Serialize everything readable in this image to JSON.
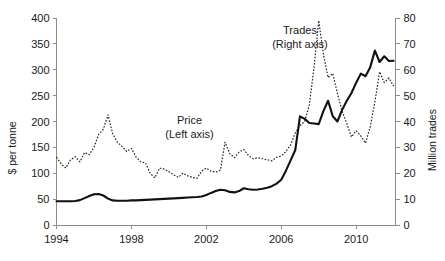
{
  "chart_data": {
    "type": "line",
    "title": "",
    "xlabel": "",
    "ylabel": "$ per tonne",
    "y2label": "Million trades",
    "xlim": [
      1994,
      2012.1
    ],
    "ylim": [
      0,
      400
    ],
    "y2lim": [
      0,
      80
    ],
    "grid": false,
    "legend_position": "inline-annotations",
    "x_ticks": [
      1994,
      1998,
      2002,
      2006,
      2010
    ],
    "x_tick_labels": [
      "1994",
      "1998",
      "2002",
      "2006",
      "2010"
    ],
    "y_ticks": [
      0,
      50,
      100,
      150,
      200,
      250,
      300,
      350,
      400
    ],
    "y_tick_labels": [
      "0",
      "50",
      "100",
      "150",
      "200",
      "250",
      "300",
      "350",
      "400"
    ],
    "y2_ticks": [
      0,
      10,
      20,
      30,
      40,
      50,
      60,
      70,
      80
    ],
    "y2_tick_labels": [
      "0",
      "10",
      "20",
      "30",
      "40",
      "50",
      "60",
      "70",
      "80"
    ],
    "annotations": [
      {
        "name": "price-label",
        "line1": "Price",
        "line2": "(Left axis)",
        "x": 2001.1,
        "y": 196
      },
      {
        "name": "trades-label",
        "line1": "Trades",
        "line2": "(Right axis)",
        "x": 2007.0,
        "y": 74
      }
    ],
    "series": [
      {
        "name": "Price",
        "axis": "left",
        "style": "dotted",
        "unit": "$ per tonne",
        "x": [
          1994.0,
          1994.25,
          1994.5,
          1994.75,
          1995.0,
          1995.25,
          1995.5,
          1995.75,
          1996.0,
          1996.25,
          1996.5,
          1996.75,
          1997.0,
          1997.25,
          1997.5,
          1997.75,
          1998.0,
          1998.25,
          1998.5,
          1998.75,
          1999.0,
          1999.25,
          1999.5,
          1999.75,
          2000.0,
          2000.25,
          2000.5,
          2000.75,
          2001.0,
          2001.25,
          2001.5,
          2001.75,
          2002.0,
          2002.25,
          2002.5,
          2002.75,
          2003.0,
          2003.25,
          2003.5,
          2003.75,
          2004.0,
          2004.25,
          2004.5,
          2004.75,
          2005.0,
          2005.25,
          2005.5,
          2005.75,
          2006.0,
          2006.25,
          2006.5,
          2006.75,
          2007.0,
          2007.25,
          2007.5,
          2007.75,
          2008.0,
          2008.25,
          2008.5,
          2008.75,
          2009.0,
          2009.25,
          2009.5,
          2009.75,
          2010.0,
          2010.25,
          2010.5,
          2010.75,
          2011.0,
          2011.25,
          2011.5,
          2011.75,
          2012.0
        ],
        "values": [
          131,
          118,
          110,
          126,
          132,
          122,
          140,
          136,
          150,
          175,
          185,
          213,
          176,
          160,
          152,
          142,
          148,
          131,
          122,
          120,
          100,
          91,
          110,
          108,
          103,
          97,
          92,
          100,
          95,
          92,
          90,
          104,
          110,
          104,
          102,
          106,
          160,
          138,
          130,
          141,
          146,
          134,
          128,
          130,
          128,
          126,
          124,
          131,
          133,
          142,
          155,
          178,
          192,
          200,
          232,
          305,
          395,
          330,
          285,
          293,
          254,
          220,
          196,
          170,
          182,
          172,
          158,
          190,
          238,
          296,
          275,
          284,
          268
        ]
      },
      {
        "name": "Trades",
        "axis": "right",
        "style": "solid",
        "unit": "Million trades",
        "x": [
          1994.0,
          1994.25,
          1994.5,
          1994.75,
          1995.0,
          1995.25,
          1995.5,
          1995.75,
          1996.0,
          1996.25,
          1996.5,
          1996.75,
          1997.0,
          1997.25,
          1997.5,
          1997.75,
          1998.0,
          1998.25,
          1998.5,
          1998.75,
          1999.0,
          1999.25,
          1999.5,
          1999.75,
          2000.0,
          2000.25,
          2000.5,
          2000.75,
          2001.0,
          2001.25,
          2001.5,
          2001.75,
          2002.0,
          2002.25,
          2002.5,
          2002.75,
          2003.0,
          2003.25,
          2003.5,
          2003.75,
          2004.0,
          2004.25,
          2004.5,
          2004.75,
          2005.0,
          2005.25,
          2005.5,
          2005.75,
          2006.0,
          2006.25,
          2006.5,
          2006.75,
          2007.0,
          2007.25,
          2007.5,
          2007.75,
          2008.0,
          2008.25,
          2008.5,
          2008.75,
          2009.0,
          2009.25,
          2009.5,
          2009.75,
          2010.0,
          2010.25,
          2010.5,
          2010.75,
          2011.0,
          2011.25,
          2011.5,
          2011.75,
          2012.0
        ],
        "values": [
          9.2,
          9.2,
          9.2,
          9.2,
          9.3,
          9.6,
          10.4,
          11.2,
          11.9,
          12.0,
          11.4,
          10.2,
          9.5,
          9.4,
          9.4,
          9.4,
          9.5,
          9.5,
          9.6,
          9.7,
          9.8,
          9.9,
          10.0,
          10.1,
          10.2,
          10.3,
          10.4,
          10.5,
          10.6,
          10.7,
          10.8,
          11.0,
          11.6,
          12.4,
          13.1,
          13.6,
          13.4,
          12.8,
          12.6,
          13.1,
          14.2,
          13.8,
          13.6,
          13.7,
          14.0,
          14.4,
          15.0,
          16.0,
          17.5,
          21.0,
          25.0,
          29.0,
          42.0,
          41.0,
          39.4,
          39.2,
          39.0,
          44.0,
          48.0,
          42.0,
          40.0,
          44.5,
          48.0,
          51.0,
          55.0,
          58.5,
          57.5,
          61.0,
          67.4,
          63.0,
          65.2,
          63.4,
          63.5
        ]
      }
    ]
  }
}
